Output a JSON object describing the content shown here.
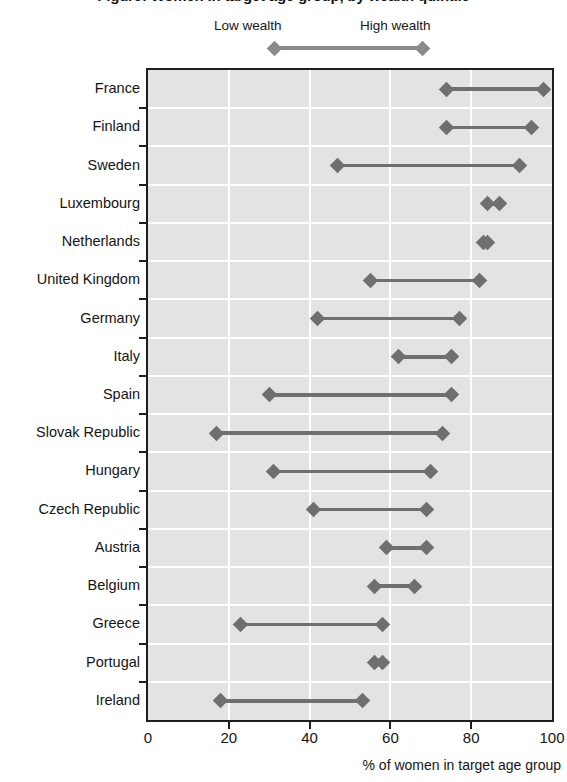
{
  "chart_data": {
    "type": "dumbbell",
    "title": "Figure: Women in target age group, by wealth quintile",
    "xlabel": "% of women in target age group",
    "ylabel": "",
    "xlim": [
      0,
      100
    ],
    "xticks": [
      0,
      20,
      40,
      60,
      80,
      100
    ],
    "xtick_labels": [
      "0",
      "20",
      "40",
      "60",
      "80",
      "100"
    ],
    "grid": "vertical-white-gridlines",
    "legend_position": "top-center",
    "legend": [
      {
        "name": "Low wealth",
        "marker": "diamond",
        "color": "#8a8a8a"
      },
      {
        "name": "High wealth",
        "marker": "diamond",
        "color": "#8a8a8a"
      }
    ],
    "series": [
      {
        "name": "Low wealth",
        "values": [
          74,
          74,
          47,
          84,
          83,
          55,
          42,
          62,
          30,
          17,
          31,
          41,
          59,
          56,
          23,
          56,
          18
        ]
      },
      {
        "name": "High wealth",
        "values": [
          98,
          95,
          92,
          87,
          84,
          82,
          77,
          75,
          75,
          73,
          70,
          69,
          69,
          66,
          58,
          58,
          53
        ]
      }
    ],
    "categories": [
      "France",
      "Finland",
      "Sweden",
      "Luxembourg",
      "Netherlands",
      "United Kingdom",
      "Germany",
      "Italy",
      "Spain",
      "Slovak Republic",
      "Hungary",
      "Czech Republic",
      "Austria",
      "Belgium",
      "Greece",
      "Portugal",
      "Ireland"
    ],
    "rows": [
      {
        "category": "France",
        "low": 74,
        "high": 98
      },
      {
        "category": "Finland",
        "low": 74,
        "high": 95
      },
      {
        "category": "Sweden",
        "low": 47,
        "high": 92
      },
      {
        "category": "Luxembourg",
        "low": 84,
        "high": 87
      },
      {
        "category": "Netherlands",
        "low": 83,
        "high": 84
      },
      {
        "category": "United Kingdom",
        "low": 55,
        "high": 82
      },
      {
        "category": "Germany",
        "low": 42,
        "high": 77
      },
      {
        "category": "Italy",
        "low": 62,
        "high": 75
      },
      {
        "category": "Spain",
        "low": 30,
        "high": 75
      },
      {
        "category": "Slovak Republic",
        "low": 17,
        "high": 73
      },
      {
        "category": "Hungary",
        "low": 31,
        "high": 70
      },
      {
        "category": "Czech Republic",
        "low": 41,
        "high": 69
      },
      {
        "category": "Austria",
        "low": 59,
        "high": 69
      },
      {
        "category": "Belgium",
        "low": 56,
        "high": 66
      },
      {
        "category": "Greece",
        "low": 23,
        "high": 58
      },
      {
        "category": "Portugal",
        "low": 56,
        "high": 58
      },
      {
        "category": "Ireland",
        "low": 18,
        "high": 53
      }
    ],
    "colors": {
      "marker": "#6f6f6f",
      "connector": "#6f6f6f",
      "plot_background": "#e3e3e3",
      "gridline": "#ffffff",
      "axis": "#1e1e1e"
    }
  }
}
